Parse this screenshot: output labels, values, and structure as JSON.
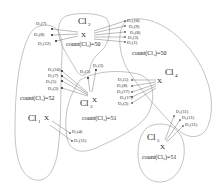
{
  "diagram": {
    "type": "cluster-assignment-diagram",
    "clusters": [
      {
        "id": "cl1",
        "label": "Cl",
        "sub": "1",
        "count_label": "count(Cl₁)=52",
        "centroid_mark": "X"
      },
      {
        "id": "cl2",
        "label": "Cl",
        "sub": "2",
        "count_label": "count(Cl₂)=50",
        "centroid_mark": "X"
      },
      {
        "id": "cl3",
        "label": "Cl",
        "sub": "3",
        "count_label": "count(Cl₃)=51",
        "centroid_mark": "X"
      },
      {
        "id": "cl4",
        "label": "Cl",
        "sub": "4",
        "count_label": "count(Cl₄)=50",
        "centroid_mark": "X"
      },
      {
        "id": "cl5",
        "label": "Cl",
        "sub": "5",
        "count_label": "count(Cl₅)=51",
        "centroid_mark": "X"
      }
    ],
    "objects": {
      "to_cl2_from_cl1": [
        "O₁(7)",
        "O₁(8)",
        "O₁(12)"
      ],
      "to_cl2_from_cl4": [
        "O₁(10)",
        "O₁(9)",
        "O₁(8)",
        "O₁(3)",
        "O₁(1)"
      ],
      "to_cl3_from_cl1": [
        "O₁(10)",
        "O₁(7)",
        "O₁(5)",
        "O₁(3)"
      ],
      "to_cl3_from_cl2": [
        "O₁(5)",
        "O₁(3)"
      ],
      "to_cl4_from_cl3": [
        "O₁(5)",
        "O₁(8)",
        "O₁(17)",
        "O₁(17)",
        "O₁(3)"
      ],
      "to_cl5_from_cl4": [
        "O₁(11)",
        "O₁(11)",
        "O₁(11)"
      ],
      "to_cl1_from_cl3": [
        "O₁(4)",
        "O₁(11)"
      ]
    }
  }
}
